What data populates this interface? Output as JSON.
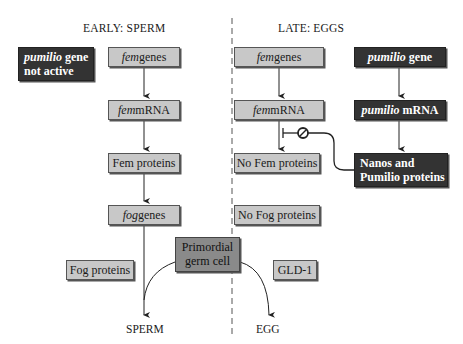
{
  "headers": {
    "left": "EARLY: SPERM",
    "right": "LATE: EGGS"
  },
  "early": {
    "pumilio_inactive": {
      "italic": "pumilio",
      "rest": " gene",
      "line2": "not active"
    },
    "fem_genes": {
      "italic": "fem",
      "rest": " genes"
    },
    "fem_mrna": {
      "italic": "fem",
      "rest": " mRNA"
    },
    "fem_proteins": "Fem proteins",
    "fog_genes": {
      "italic": "fog",
      "rest": " genes"
    },
    "fog_proteins": "Fog proteins"
  },
  "late": {
    "fem_genes": {
      "italic": "fem",
      "rest": " genes"
    },
    "fem_mrna": {
      "italic": "fem",
      "rest": " mRNA"
    },
    "no_fem_proteins": "No Fem proteins",
    "no_fog_proteins": "No Fog proteins",
    "pumilio_gene": {
      "italic": "pumilio",
      "rest": " gene"
    },
    "pumilio_mrna": {
      "italic": "pumilio",
      "rest": " mRNA"
    },
    "nanos_pumilio": {
      "line1": "Nanos and",
      "line2": "Pumilio proteins"
    },
    "gld1": "GLD-1"
  },
  "center": {
    "line1": "Primordial",
    "line2": "germ cell"
  },
  "outcomes": {
    "sperm": "SPERM",
    "egg": "EGG"
  },
  "colors": {
    "gray_box": "#c8c8c8",
    "dark_box": "#333333",
    "germ_cell_box": "#8a8a8a",
    "divider": "#555555"
  }
}
